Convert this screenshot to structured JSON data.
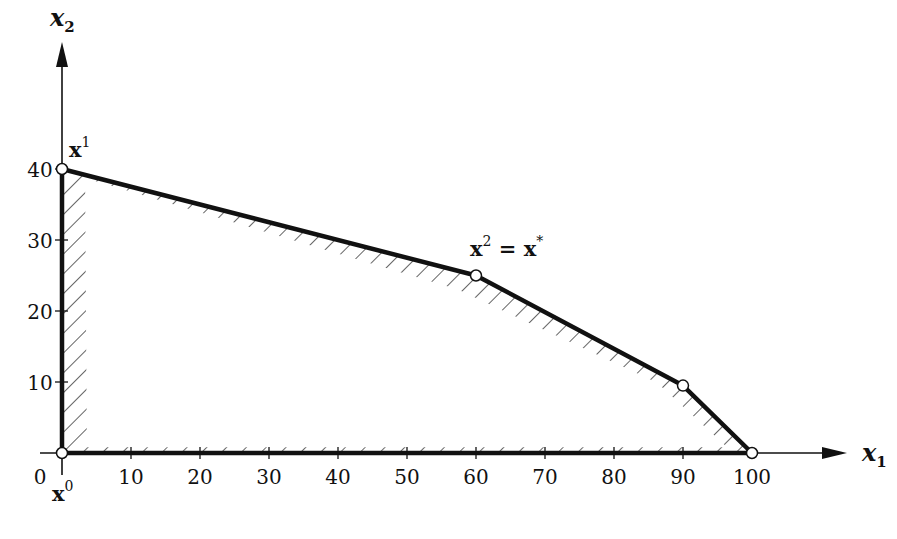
{
  "chart_data": {
    "type": "area",
    "title": "",
    "xlabel": "x1",
    "ylabel": "x2",
    "xlim": [
      0,
      100
    ],
    "ylim": [
      0,
      40
    ],
    "grid": false,
    "x_ticks": [
      0,
      10,
      20,
      30,
      40,
      50,
      60,
      70,
      80,
      90,
      100
    ],
    "y_ticks": [
      10,
      20,
      30,
      40
    ],
    "feasible_region": {
      "vertices": [
        [
          0,
          0
        ],
        [
          0,
          40
        ],
        [
          60,
          25
        ],
        [
          90,
          9.5
        ],
        [
          100,
          0
        ]
      ],
      "fill": "hatched"
    },
    "labeled_points": [
      {
        "name": "x0",
        "label": "x",
        "sup": "0",
        "x": 0,
        "y": 0
      },
      {
        "name": "x1",
        "label": "x",
        "sup": "1",
        "x": 0,
        "y": 40
      },
      {
        "name": "x2",
        "label": "x",
        "sup": "2",
        "suffix": " = x",
        "suffix_sup": "*",
        "x": 60,
        "y": 25
      }
    ],
    "unlabeled_points": [
      {
        "x": 90,
        "y": 9.5
      },
      {
        "x": 100,
        "y": 0
      }
    ]
  },
  "axes": {
    "x_name": "x",
    "x_sub": "1",
    "y_name": "x",
    "y_sub": "2",
    "origin_label": "0"
  },
  "colors": {
    "line": "#111111",
    "point_fill": "#ffffff",
    "background": "#ffffff"
  }
}
